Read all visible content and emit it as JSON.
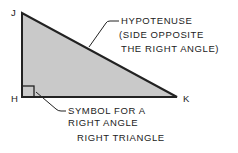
{
  "diagram": {
    "title": "RIGHT TRIANGLE",
    "vertices": {
      "top": "J",
      "right_angle": "H",
      "right": "K"
    },
    "hypotenuse_label": [
      "HYPOTENUSE",
      "(SIDE OPPOSITE",
      "THE RIGHT ANGLE)"
    ],
    "symbol_label": [
      "SYMBOL FOR A",
      "RIGHT ANGLE"
    ],
    "colors": {
      "fill": "#c8c8c8",
      "stroke": "#222222"
    }
  }
}
